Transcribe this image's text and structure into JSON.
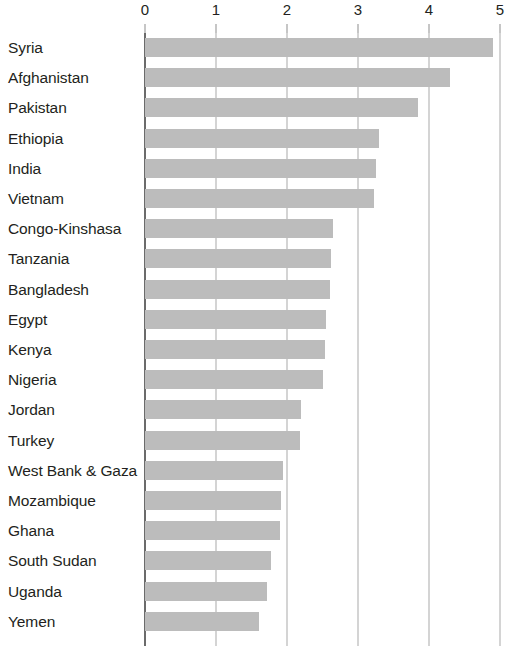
{
  "chart_data": {
    "type": "bar",
    "orientation": "horizontal",
    "title": "",
    "subtitle": "",
    "xlabel": "",
    "ylabel": "",
    "xlim": [
      0,
      5
    ],
    "grid": true,
    "legend": null,
    "xticks": [
      "0",
      "1",
      "2",
      "3",
      "4",
      "5"
    ],
    "xtick_values": [
      0,
      1,
      2,
      3,
      4,
      5
    ],
    "categories": [
      "Syria",
      "Afghanistan",
      "Pakistan",
      "Ethiopia",
      "India",
      "Vietnam",
      "Congo-Kinshasa",
      "Tanzania",
      "Bangladesh",
      "Egypt",
      "Kenya",
      "Nigeria",
      "Jordan",
      "Turkey",
      "West Bank & Gaza",
      "Mozambique",
      "Ghana",
      "South Sudan",
      "Uganda",
      "Yemen"
    ],
    "values": [
      4.9,
      4.3,
      3.85,
      3.3,
      3.25,
      3.22,
      2.65,
      2.62,
      2.6,
      2.55,
      2.53,
      2.5,
      2.2,
      2.18,
      1.95,
      1.92,
      1.9,
      1.78,
      1.72,
      1.6
    ],
    "bar_color": "#bcbcbc",
    "gridline_color": "#a9a9a9",
    "axis_color": "#6b6b6b",
    "text_color": "#231f20",
    "background": "#ffffff"
  }
}
